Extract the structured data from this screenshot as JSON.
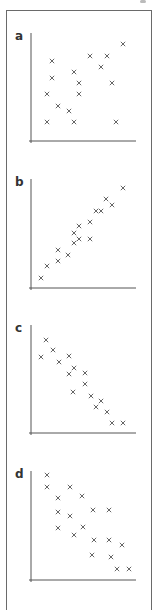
{
  "figure": {
    "frame_color": "#6a6a6a",
    "marker_color": "#555555",
    "axis_color": "#555555"
  },
  "chart_data": [
    {
      "type": "scatter",
      "label": "a",
      "title": "",
      "xlabel": "",
      "ylabel": "",
      "grid": false,
      "marker": "x",
      "pattern": "weak positive correlation",
      "points_px": [
        [
          52,
          61
        ],
        [
          52,
          78
        ],
        [
          47,
          94
        ],
        [
          58,
          106
        ],
        [
          47,
          122
        ],
        [
          69,
          111
        ],
        [
          74,
          122
        ],
        [
          74,
          72
        ],
        [
          79,
          83
        ],
        [
          79,
          94
        ],
        [
          90,
          56
        ],
        [
          101,
          67
        ],
        [
          107,
          56
        ],
        [
          112,
          83
        ],
        [
          123,
          44
        ],
        [
          116,
          122
        ]
      ],
      "axes_px": {
        "origin": [
          31,
          141
        ],
        "x_end": 136,
        "y_top": 33
      }
    },
    {
      "type": "scatter",
      "label": "b",
      "title": "",
      "xlabel": "",
      "ylabel": "",
      "grid": false,
      "marker": "x",
      "pattern": "strong positive correlation",
      "points_px": [
        [
          41,
          278
        ],
        [
          47,
          266
        ],
        [
          58,
          261
        ],
        [
          58,
          250
        ],
        [
          68,
          255
        ],
        [
          74,
          243
        ],
        [
          74,
          233
        ],
        [
          79,
          239
        ],
        [
          79,
          226
        ],
        [
          90,
          239
        ],
        [
          90,
          222
        ],
        [
          96,
          211
        ],
        [
          101,
          211
        ],
        [
          106,
          199
        ],
        [
          112,
          205
        ],
        [
          123,
          188
        ]
      ],
      "axes_px": {
        "origin": [
          31,
          288
        ],
        "x_end": 136,
        "y_top": 179
      }
    },
    {
      "type": "scatter",
      "label": "c",
      "title": "",
      "xlabel": "",
      "ylabel": "",
      "grid": false,
      "marker": "x",
      "pattern": "strong negative correlation",
      "points_px": [
        [
          46,
          340
        ],
        [
          41,
          357
        ],
        [
          53,
          350
        ],
        [
          59,
          362
        ],
        [
          69,
          356
        ],
        [
          69,
          374
        ],
        [
          74,
          368
        ],
        [
          85,
          373
        ],
        [
          85,
          384
        ],
        [
          73,
          392
        ],
        [
          91,
          396
        ],
        [
          101,
          401
        ],
        [
          96,
          407
        ],
        [
          107,
          412
        ],
        [
          112,
          423
        ],
        [
          123,
          423
        ]
      ],
      "axes_px": {
        "origin": [
          31,
          433
        ],
        "x_end": 136,
        "y_top": 325
      }
    },
    {
      "type": "scatter",
      "label": "d",
      "title": "",
      "xlabel": "",
      "ylabel": "",
      "grid": false,
      "marker": "x",
      "pattern": "moderate negative correlation",
      "points_px": [
        [
          47,
          475
        ],
        [
          47,
          487
        ],
        [
          70,
          487
        ],
        [
          58,
          498
        ],
        [
          82,
          496
        ],
        [
          58,
          512
        ],
        [
          70,
          516
        ],
        [
          93,
          510
        ],
        [
          109,
          510
        ],
        [
          58,
          528
        ],
        [
          83,
          527
        ],
        [
          74,
          535
        ],
        [
          94,
          540
        ],
        [
          109,
          540
        ],
        [
          122,
          545
        ],
        [
          92,
          555
        ],
        [
          111,
          557
        ],
        [
          117,
          569
        ],
        [
          129,
          569
        ]
      ],
      "axes_px": {
        "origin": [
          31,
          580
        ],
        "x_end": 136,
        "y_top": 471
      }
    }
  ]
}
